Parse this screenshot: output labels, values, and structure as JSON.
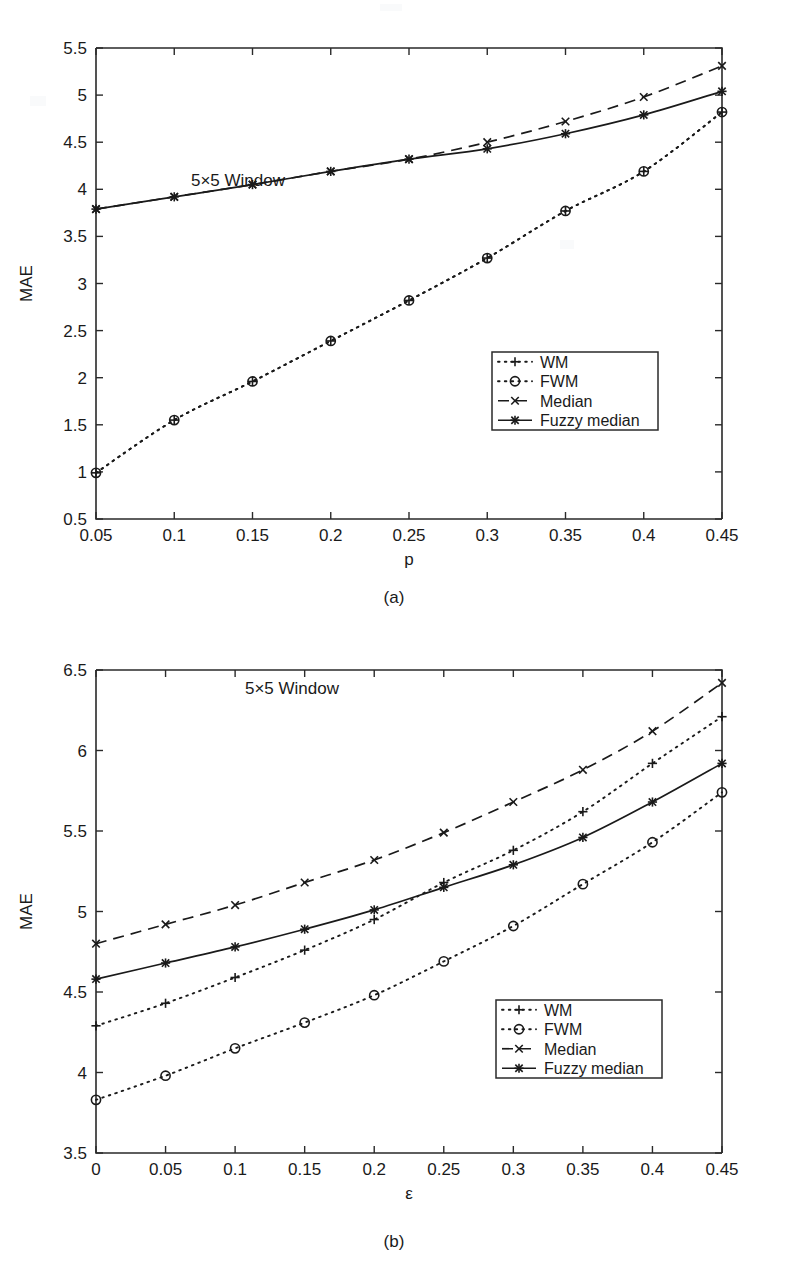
{
  "figure": {
    "panels": [
      {
        "id": "a",
        "subcaption": "(a)",
        "annotation": "5×5 Window",
        "chart_data": {
          "type": "line",
          "title": "",
          "xlabel": "p",
          "ylabel": "MAE",
          "xlim": [
            0.05,
            0.45
          ],
          "ylim": [
            0.5,
            5.5
          ],
          "grid": false,
          "legend_position": "lower-right",
          "xticks": [
            "0.05",
            "0.1",
            "0.15",
            "0.2",
            "0.25",
            "0.3",
            "0.35",
            "0.4",
            "0.45"
          ],
          "xtick_values": [
            0.05,
            0.1,
            0.15,
            0.2,
            0.25,
            0.3,
            0.35,
            0.4,
            0.45
          ],
          "yticks": [
            "0.5",
            "1",
            "1.5",
            "2",
            "2.5",
            "3",
            "3.5",
            "4",
            "4.5",
            "5",
            "5.5"
          ],
          "ytick_values": [
            0.5,
            1,
            1.5,
            2,
            2.5,
            3,
            3.5,
            4,
            4.5,
            5,
            5.5
          ],
          "x": [
            0.05,
            0.1,
            0.15,
            0.2,
            0.25,
            0.3,
            0.35,
            0.4,
            0.45
          ],
          "series": [
            {
              "name": "WM",
              "style": "dotted",
              "marker": "plus",
              "values": [
                0.99,
                1.55,
                1.96,
                2.39,
                2.82,
                3.27,
                3.77,
                4.19,
                4.82
              ]
            },
            {
              "name": "FWM",
              "style": "dotted",
              "marker": "circle",
              "values": [
                0.99,
                1.55,
                1.96,
                2.39,
                2.82,
                3.27,
                3.77,
                4.19,
                4.82
              ]
            },
            {
              "name": "Median",
              "style": "dashed",
              "marker": "cross",
              "values": [
                3.79,
                3.92,
                4.05,
                4.19,
                4.32,
                4.5,
                4.72,
                4.98,
                5.31
              ]
            },
            {
              "name": "Fuzzy median",
              "style": "solid",
              "marker": "star",
              "values": [
                3.79,
                3.92,
                4.05,
                4.19,
                4.32,
                4.43,
                4.59,
                4.79,
                5.04
              ]
            }
          ]
        }
      },
      {
        "id": "b",
        "subcaption": "(b)",
        "annotation": "5×5 Window",
        "chart_data": {
          "type": "line",
          "title": "",
          "xlabel": "ε",
          "ylabel": "MAE",
          "xlim": [
            0,
            0.45
          ],
          "ylim": [
            3.5,
            6.5
          ],
          "grid": false,
          "legend_position": "lower-right",
          "xticks": [
            "0",
            "0.05",
            "0.1",
            "0.15",
            "0.2",
            "0.25",
            "0.3",
            "0.35",
            "0.4",
            "0.45"
          ],
          "xtick_values": [
            0,
            0.05,
            0.1,
            0.15,
            0.2,
            0.25,
            0.3,
            0.35,
            0.4,
            0.45
          ],
          "yticks": [
            "3.5",
            "4",
            "4.5",
            "5",
            "5.5",
            "6",
            "6.5"
          ],
          "ytick_values": [
            3.5,
            4,
            4.5,
            5,
            5.5,
            6,
            6.5
          ],
          "x": [
            0,
            0.05,
            0.1,
            0.15,
            0.2,
            0.25,
            0.3,
            0.35,
            0.4,
            0.45
          ],
          "series": [
            {
              "name": "WM",
              "style": "dotted",
              "marker": "plus",
              "values": [
                4.29,
                4.43,
                4.59,
                4.76,
                4.95,
                5.18,
                5.38,
                5.62,
                5.92,
                6.21
              ]
            },
            {
              "name": "FWM",
              "style": "dotted",
              "marker": "circle",
              "values": [
                3.83,
                3.98,
                4.15,
                4.31,
                4.48,
                4.69,
                4.91,
                5.17,
                5.43,
                5.74
              ]
            },
            {
              "name": "Median",
              "style": "dashed",
              "marker": "cross",
              "values": [
                4.8,
                4.92,
                5.04,
                5.18,
                5.32,
                5.49,
                5.68,
                5.88,
                6.12,
                6.42
              ]
            },
            {
              "name": "Fuzzy median",
              "style": "solid",
              "marker": "star",
              "values": [
                4.58,
                4.68,
                4.78,
                4.89,
                5.01,
                5.15,
                5.29,
                5.46,
                5.68,
                5.92
              ]
            }
          ]
        }
      }
    ]
  }
}
